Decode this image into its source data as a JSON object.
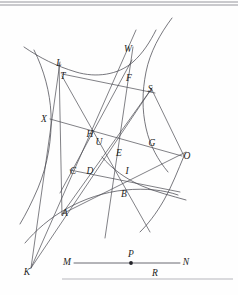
{
  "figure": {
    "background_color": "#fefefe",
    "ink_color": "#4a4a52",
    "label_color": "#1d1d22",
    "rule_color": "#8a8a92",
    "labels": [
      {
        "id": "L",
        "text": "L",
        "x": 59,
        "y": 66
      },
      {
        "id": "T",
        "text": "T",
        "x": 63,
        "y": 79
      },
      {
        "id": "W",
        "text": "W",
        "x": 128,
        "y": 52
      },
      {
        "id": "F",
        "text": "F",
        "x": 129,
        "y": 81
      },
      {
        "id": "S",
        "text": "S",
        "x": 150,
        "y": 92
      },
      {
        "id": "X",
        "text": "X",
        "x": 44,
        "y": 122
      },
      {
        "id": "H",
        "text": "H",
        "x": 90,
        "y": 137
      },
      {
        "id": "U",
        "text": "U",
        "x": 99,
        "y": 145
      },
      {
        "id": "G",
        "text": "G",
        "x": 152,
        "y": 146
      },
      {
        "id": "O",
        "text": "O",
        "x": 187,
        "y": 159
      },
      {
        "id": "E",
        "text": "E",
        "x": 119,
        "y": 156
      },
      {
        "id": "C",
        "text": "C",
        "x": 73,
        "y": 174
      },
      {
        "id": "D",
        "text": "D",
        "x": 90,
        "y": 174
      },
      {
        "id": "I",
        "text": "I",
        "x": 127,
        "y": 174
      },
      {
        "id": "B",
        "text": "B",
        "x": 124,
        "y": 197
      },
      {
        "id": "A",
        "text": "A",
        "x": 65,
        "y": 216
      },
      {
        "id": "K",
        "text": "K",
        "x": 27,
        "y": 275
      },
      {
        "id": "M",
        "text": "M",
        "x": 67,
        "y": 265
      },
      {
        "id": "P",
        "text": "P",
        "x": 131,
        "y": 257
      },
      {
        "id": "N",
        "text": "N",
        "x": 186,
        "y": 265
      },
      {
        "id": "R",
        "text": "R",
        "x": 155,
        "y": 276
      }
    ],
    "points": [
      {
        "id": "P",
        "x": 131,
        "y": 263,
        "radius": 1.9
      }
    ],
    "segment_mn": {
      "label_left": "M",
      "label_right": "N",
      "x1": 74,
      "y1": 263,
      "x2": 180,
      "y2": 263
    },
    "baseline_r": {
      "label": "R",
      "x1": 62,
      "y1": 279,
      "x2": 233,
      "y2": 279
    },
    "top_rules": [
      {
        "x1": 0,
        "y1": 2.0,
        "x2": 238,
        "y2": 2.0
      },
      {
        "x1": 0,
        "y1": 5.0,
        "x2": 238,
        "y2": 5.0
      }
    ],
    "curves": [
      {
        "id": "hyperbola-upper-left",
        "d": "M 24,47 C 40,58 56,66 76,72 C 96,78 118,75 133,62 C 143,53 150,42 156,30"
      },
      {
        "id": "hyperbola-upper-right",
        "d": "M 172,18 C 160,34 150,52 146,72 C 142,92 142,110 146,128 C 150,146 158,160 168,172"
      },
      {
        "id": "hyperbola-left-branch",
        "d": "M 34,50 C 44,70 50,92 51,114 C 52,138 48,164 38,188 C 32,202 26,214 20,224"
      },
      {
        "id": "hyperbola-lower-left",
        "d": "M 25,243 C 36,230 50,218 66,209 C 84,199 104,192 125,190 C 146,188 164,190 178,195"
      },
      {
        "id": "hyperbola-lower-right",
        "d": "M 186,200 C 172,196 156,192 142,186 C 126,179 112,169 102,157"
      },
      {
        "id": "branch-right-lower",
        "d": "M 184,156 C 178,170 172,186 164,200 C 156,214 148,224 140,232"
      }
    ],
    "chords": [
      {
        "id": "K-to-W",
        "x1": 31,
        "y1": 268,
        "x2": 136,
        "y2": 30
      },
      {
        "id": "K-to-S",
        "x1": 31,
        "y1": 268,
        "x2": 152,
        "y2": 88
      },
      {
        "id": "K-to-L",
        "x1": 31,
        "y1": 268,
        "x2": 60,
        "y2": 62
      },
      {
        "id": "X-to-O",
        "x1": 50,
        "y1": 119,
        "x2": 182,
        "y2": 156
      },
      {
        "id": "T-to-S",
        "x1": 62,
        "y1": 74,
        "x2": 155,
        "y2": 93
      },
      {
        "id": "C-to-B",
        "x1": 70,
        "y1": 170,
        "x2": 180,
        "y2": 192
      },
      {
        "id": "L-to-A",
        "x1": 59,
        "y1": 63,
        "x2": 62,
        "y2": 215
      },
      {
        "id": "A-to-S",
        "x1": 62,
        "y1": 214,
        "x2": 152,
        "y2": 88
      },
      {
        "id": "W-down",
        "x1": 133,
        "y1": 47,
        "x2": 105,
        "y2": 238
      },
      {
        "id": "S-to-O-leg",
        "x1": 152,
        "y1": 90,
        "x2": 184,
        "y2": 156
      },
      {
        "id": "T-to-I",
        "x1": 62,
        "y1": 76,
        "x2": 150,
        "y2": 232
      },
      {
        "id": "A-to-G",
        "x1": 62,
        "y1": 214,
        "x2": 186,
        "y2": 152
      },
      {
        "id": "D-to-F",
        "x1": 60,
        "y1": 193,
        "x2": 132,
        "y2": 60
      }
    ]
  }
}
